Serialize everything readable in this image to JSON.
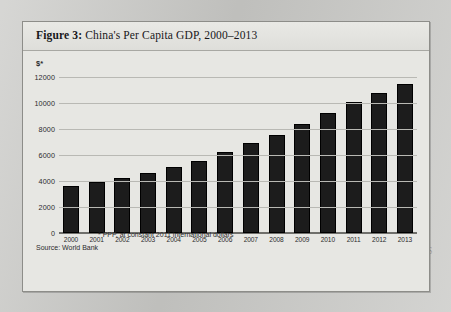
{
  "figure": {
    "label": "Figure 3:",
    "title": "China's Per Capita GDP, 2000–2013"
  },
  "axis": {
    "y_unit_label": "$*",
    "y_ticks": [
      "12000",
      "10000",
      "8000",
      "6000",
      "4000",
      "2000",
      "0"
    ]
  },
  "footnotes": {
    "ppp": "* PPP, at constant 2011 international dollars",
    "source": "Source: World Bank"
  },
  "background_text": {
    "bleed_through": "Mr. Li's the C. I. S. T. S"
  },
  "colors": {
    "bar": "#1c1c1c",
    "gridline": "#b9b9b4",
    "card": "#e7e7e3",
    "page": "#c9c9c6"
  },
  "chart_data": {
    "type": "bar",
    "title": "China's Per Capita GDP, 2000–2013",
    "xlabel": "",
    "ylabel": "$*",
    "ylim": [
      0,
      12000
    ],
    "ytick_step": 2000,
    "grid": true,
    "legend": null,
    "categories": [
      "2000",
      "2001",
      "2002",
      "2003",
      "2004",
      "2005",
      "2006",
      "2007",
      "2008",
      "2009",
      "2010",
      "2011",
      "2012",
      "2013"
    ],
    "values": [
      3650,
      3950,
      4250,
      4600,
      5050,
      5550,
      6200,
      6950,
      7550,
      8350,
      9200,
      10050,
      10800,
      11500
    ]
  }
}
